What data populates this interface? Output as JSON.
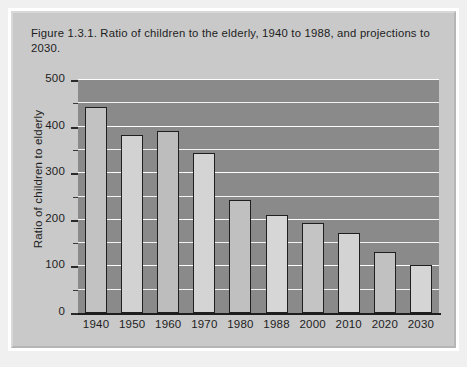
{
  "caption": "Figure 1.3.1. Ratio of children to the elderly, 1940 to 1988, and projections to 2030.",
  "chart_data": {
    "type": "bar",
    "title": "Figure 1.3.1. Ratio of children to the elderly, 1940 to 1988, and projections to 2030.",
    "xlabel": "",
    "ylabel": "Ratio of children to elderly",
    "categories": [
      "1940",
      "1950",
      "1960",
      "1970",
      "1980",
      "1988",
      "2000",
      "2010",
      "2020",
      "2030"
    ],
    "values": [
      442,
      382,
      390,
      343,
      242,
      210,
      193,
      172,
      131,
      103
    ],
    "ylim": [
      0,
      500
    ],
    "ytick_labels": [
      "0",
      "100",
      "200",
      "300",
      "400",
      "500"
    ],
    "ytick_values": [
      0,
      100,
      200,
      300,
      400,
      500
    ],
    "minor_tick_step": 50,
    "grid": true,
    "legend": null,
    "bar_colors": [
      "#c2c2c2",
      "#d2d2d2",
      "#bdbdbd",
      "#d4d4d4",
      "#c0c0c0",
      "#d6d6d6",
      "#c4c4c4",
      "#d3d3d3",
      "#c1c1c1",
      "#d5d5d5"
    ],
    "plot_background": "#8a8a8a",
    "gridline_color": "#fdfdfd",
    "bar_outline_color": "#1f1f1f",
    "card_background": "#c9c9c9",
    "text_color": "#1d1d1d"
  }
}
